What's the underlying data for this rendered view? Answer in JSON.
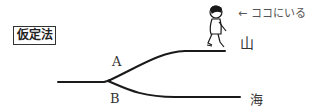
{
  "title_box": "仮定法",
  "note": "← ココにいる",
  "labels": {
    "branch_a": "A",
    "branch_b": "B",
    "mountain": "山",
    "sea": "海"
  },
  "icons": {
    "person": "walking-person-icon"
  }
}
